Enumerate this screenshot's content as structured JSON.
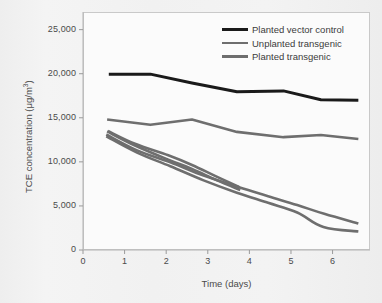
{
  "figure": {
    "background_color": "#f1f1f1",
    "plot_background": "#fbfbfb",
    "frame_color": "#c9c9c9"
  },
  "chart_data": {
    "type": "line",
    "title": "",
    "xlabel": "Time (days)",
    "ylabel_prefix": "TCE concentration (μg/m",
    "ylabel_sup": "3",
    "ylabel_suffix": ")",
    "ylabel_full": "TCE concentration (μg/m³)",
    "xlim": [
      0,
      6.9
    ],
    "ylim": [
      0,
      27000
    ],
    "xticks": [
      0,
      1,
      2,
      3,
      4,
      5,
      6
    ],
    "xtick_labels": [
      "0",
      "1",
      "2",
      "3",
      "4",
      "5",
      "6"
    ],
    "yticks": [
      0,
      5000,
      10000,
      15000,
      20000,
      25000
    ],
    "ytick_labels": [
      "0",
      "5,000",
      "10,000",
      "15,000",
      "20,000",
      "25,000"
    ],
    "grid": false,
    "legend_position": "top-right",
    "series": [
      {
        "name": "Planted vector control",
        "color": "#1a1a1a",
        "width": 3.0,
        "x": [
          0.62,
          1.62,
          2.62,
          3.7,
          4.82,
          5.72,
          6.62
        ],
        "y": [
          19950,
          19950,
          18950,
          17950,
          18050,
          17050,
          17000
        ]
      },
      {
        "name": "Unplanted transgenic",
        "color": "#6e6e6e",
        "width": 2.6,
        "x": [
          0.58,
          1.62,
          2.62,
          3.7,
          4.82,
          5.72,
          6.62
        ],
        "y": [
          14800,
          14200,
          14800,
          13400,
          12800,
          13050,
          12600
        ]
      },
      {
        "name": "Planted transgenic",
        "color": "#6e6e6e",
        "width": 2.6,
        "replicate": 1,
        "x": [
          0.6,
          1.25,
          2.05,
          2.62,
          3.2,
          3.75
        ],
        "y": [
          13500,
          12050,
          10750,
          9650,
          8350,
          7150
        ]
      },
      {
        "name": "Planted transgenic",
        "color": "#6e6e6e",
        "width": 2.6,
        "replicate": 2,
        "x": [
          0.58,
          1.25,
          2.05,
          2.62,
          3.2,
          3.78
        ],
        "y": [
          13450,
          11850,
          10250,
          9200,
          7950,
          6800
        ]
      },
      {
        "name": "Planted transgenic",
        "color": "#6e6e6e",
        "width": 2.6,
        "replicate": 3,
        "x": [
          0.56,
          1.3,
          2.1,
          2.9,
          3.7,
          4.45,
          5.15,
          5.8,
          6.62
        ],
        "y": [
          13100,
          11300,
          9950,
          8450,
          7200,
          6100,
          5100,
          4100,
          3000
        ]
      },
      {
        "name": "Planted transgenic",
        "color": "#6e6e6e",
        "width": 2.6,
        "replicate": 4,
        "x": [
          0.56,
          1.3,
          2.1,
          2.9,
          3.7,
          4.45,
          5.15,
          5.78,
          6.62
        ],
        "y": [
          12900,
          11050,
          9500,
          7900,
          6500,
          5350,
          4250,
          2600,
          2100
        ]
      }
    ],
    "legend": [
      {
        "label": "Planted vector control",
        "color": "#1a1a1a"
      },
      {
        "label": "Unplanted transgenic",
        "color": "#6e6e6e"
      },
      {
        "label": "Planted transgenic",
        "color": "#6e6e6e"
      }
    ]
  }
}
